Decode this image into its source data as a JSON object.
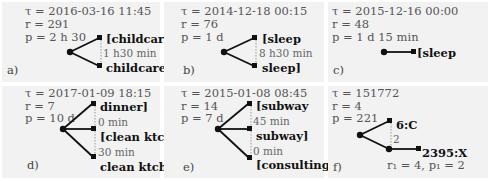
{
  "panels": [
    {
      "id": "a",
      "tag": "a)",
      "tau": "τ = 2016-03-16 11:45",
      "r": "r = 291",
      "p": "p = 2 h 30",
      "nodes": [
        "[childcare",
        "childcare]"
      ],
      "durations": [
        "1 h30 min"
      ]
    },
    {
      "id": "b",
      "tag": "b)",
      "tau": "τ = 2014-12-18 00:15",
      "r": "r = 76",
      "p": "p = 1 d",
      "nodes": [
        "[sleep",
        "sleep]"
      ],
      "durations": [
        "8 h30 min"
      ]
    },
    {
      "id": "c",
      "tag": "c)",
      "tau": "τ = 2015-12-16 00:00",
      "r": "r = 48",
      "p": "p = 1 d 15 min",
      "nodes": [
        "[sleep"
      ],
      "durations": []
    },
    {
      "id": "d",
      "tag": "d)",
      "tau": "τ = 2017-01-09 18:15",
      "r": "r = 7",
      "p": "p = 10 d",
      "nodes": [
        "dinner]",
        "[clean ktch.",
        "clean ktch.]"
      ],
      "durations": [
        "0 min",
        "30 min"
      ]
    },
    {
      "id": "e",
      "tag": "e)",
      "tau": "τ = 2015-01-08 08:45",
      "r": "r = 14",
      "p": "p = 7 d",
      "nodes": [
        "[subway",
        "subway]",
        "[consulting"
      ],
      "durations": [
        "45 min",
        "0 min"
      ]
    },
    {
      "id": "f",
      "tag": "f)",
      "tau": "τ = 151772",
      "r": "r = 4",
      "p": "p = 221",
      "nodes": [
        "6:C",
        "2395:X"
      ],
      "durations": [
        "2"
      ],
      "sub_params": "r₁ = 4, p₁ = 2"
    }
  ]
}
